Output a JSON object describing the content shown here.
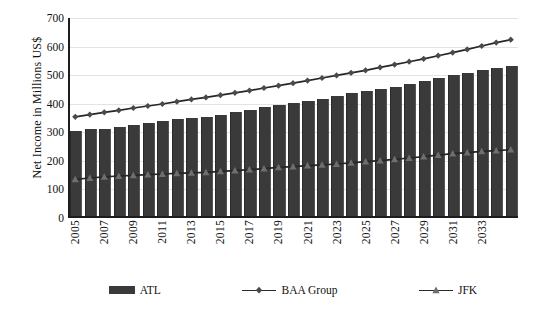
{
  "chart_data": {
    "type": "bar",
    "title": "",
    "subtitle": "",
    "xlabel": "",
    "ylabel": "Net Income in Millions US$",
    "ylim": [
      0,
      700
    ],
    "ytick_values": [
      0,
      100,
      200,
      300,
      400,
      500,
      600,
      700
    ],
    "ytick_labels": [
      "0",
      "100",
      "200",
      "300",
      "400",
      "500",
      "600",
      "700"
    ],
    "grid": true,
    "legend_position": "bottom",
    "x": [
      2005,
      2006,
      2007,
      2008,
      2009,
      2010,
      2011,
      2012,
      2013,
      2014,
      2015,
      2016,
      2017,
      2018,
      2019,
      2020,
      2021,
      2022,
      2023,
      2024,
      2025,
      2026,
      2027,
      2028,
      2029,
      2030,
      2031,
      2032,
      2033,
      2034,
      2035
    ],
    "categories": [
      "2005",
      "2006",
      "2007",
      "2008",
      "2009",
      "2010",
      "2011",
      "2012",
      "2013",
      "2014",
      "2015",
      "2016",
      "2017",
      "2018",
      "2019",
      "2020",
      "2021",
      "2022",
      "2023",
      "2024",
      "2025",
      "2026",
      "2027",
      "2028",
      "2029",
      "2030",
      "2031",
      "2032",
      "2033",
      "2034",
      "2035"
    ],
    "xtick_labels": [
      "2005",
      "2007",
      "2009",
      "2011",
      "2013",
      "2015",
      "2017",
      "2019",
      "2021",
      "2023",
      "2025",
      "2027",
      "2029",
      "2031",
      "2033"
    ],
    "xtick_values": [
      2005,
      2007,
      2009,
      2011,
      2013,
      2015,
      2017,
      2019,
      2021,
      2023,
      2025,
      2027,
      2029,
      2031,
      2033
    ],
    "series": [
      {
        "name": "ATL",
        "kind": "bar",
        "color": "#3a3a3a",
        "values": [
          305,
          312,
          313,
          318,
          325,
          333,
          339,
          345,
          350,
          355,
          362,
          370,
          377,
          388,
          394,
          403,
          409,
          417,
          428,
          438,
          446,
          452,
          460,
          470,
          481,
          490,
          500,
          508,
          518,
          525,
          533
        ]
      },
      {
        "name": "BAA Group",
        "kind": "line",
        "marker": "diamond",
        "color": "#4a4a4a",
        "values": [
          354,
          362,
          370,
          377,
          385,
          392,
          399,
          407,
          415,
          422,
          430,
          438,
          446,
          455,
          463,
          472,
          481,
          490,
          499,
          508,
          517,
          527,
          537,
          547,
          557,
          568,
          579,
          590,
          602,
          614,
          624
        ]
      },
      {
        "name": "JFK",
        "kind": "line",
        "marker": "triangle",
        "color": "#6e6e6e",
        "values": [
          135,
          140,
          144,
          147,
          149,
          152,
          154,
          156,
          158,
          160,
          163,
          166,
          169,
          173,
          177,
          180,
          183,
          186,
          189,
          193,
          197,
          201,
          205,
          210,
          215,
          220,
          225,
          229,
          233,
          236,
          239
        ]
      }
    ],
    "legend": [
      {
        "label": "ATL",
        "type": "bar",
        "color": "#3a3a3a"
      },
      {
        "label": "BAA Group",
        "type": "line-diamond",
        "color": "#4a4a4a"
      },
      {
        "label": "JFK",
        "type": "line-triangle",
        "color": "#6e6e6e"
      }
    ]
  }
}
